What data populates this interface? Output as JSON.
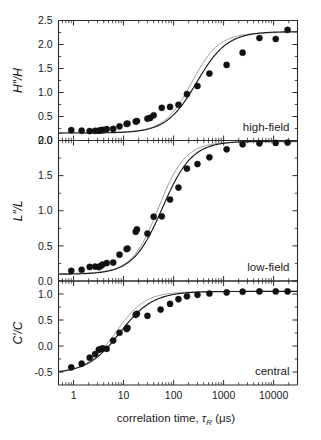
{
  "figure": {
    "width": 321,
    "height": 440,
    "background": "#ffffff",
    "ink": "#1a1a1a",
    "fit_color": "#1a1a1a",
    "fit_alt_color": "#9a9a9a",
    "marker_color": "#111111"
  },
  "xaxis": {
    "label": "correlation time,",
    "label_symbol": "τ",
    "label_subscript": "R",
    "label_units": "(μs)",
    "scale": "log",
    "min": 0.5,
    "max": 30000,
    "tick_values": [
      1,
      10,
      100,
      1000,
      10000
    ],
    "tick_labels": [
      "1",
      "10",
      "100",
      "1000",
      "10000"
    ]
  },
  "panels": [
    {
      "id": "high-field",
      "tag": "high-field",
      "ylabel": "H″/H",
      "ylabel_parts": {
        "main": "H",
        "prime": "″",
        "slash": "/",
        "denom": "H"
      },
      "ymin": 0.0,
      "ymax": 2.5,
      "ytick_values": [
        0.0,
        0.5,
        1.0,
        1.5,
        2.0,
        2.5
      ],
      "ytick_labels": [
        "0.0",
        "0.5",
        "1.0",
        "1.5",
        "2.0",
        "2.5"
      ],
      "yminor_step": 0.25
    },
    {
      "id": "low-field",
      "tag": "low-field",
      "ylabel": "L″/L",
      "ylabel_parts": {
        "main": "L",
        "prime": "″",
        "slash": "/",
        "denom": "L"
      },
      "ymin": 0.0,
      "ymax": 2.0,
      "ytick_values": [
        0.0,
        0.5,
        1.0,
        1.5,
        2.0
      ],
      "ytick_labels": [
        "0.0",
        "0.5",
        "1.0",
        "1.5",
        "2.0"
      ],
      "yminor_step": 0.25
    },
    {
      "id": "central",
      "tag": "central",
      "ylabel": "C′/C",
      "ylabel_parts": {
        "main": "C",
        "prime": "′",
        "slash": "/",
        "denom": "C"
      },
      "ymin": -0.75,
      "ymax": 1.25,
      "ytick_values": [
        -0.5,
        0.0,
        0.5,
        1.0
      ],
      "ytick_labels": [
        "-0.5",
        "0.0",
        "0.5",
        "1.0"
      ],
      "yminor_step": 0.25
    }
  ],
  "chart_data": [
    {
      "type": "scatter",
      "panel": "high-field",
      "title": "high-field",
      "xlabel": "correlation time, τR (μs)",
      "ylabel": "H″/H",
      "xscale": "log",
      "xlim": [
        0.5,
        30000
      ],
      "ylim": [
        0.0,
        2.5
      ],
      "grid": false,
      "legend": "none",
      "x": [
        0.9,
        1.45,
        2.1,
        2.7,
        3.2,
        3.5,
        3.8,
        4.6,
        6.2,
        8.3,
        11.5,
        12.0,
        17.5,
        18.5,
        30.0,
        34.0,
        40.0,
        58.0,
        85.0,
        125.0,
        185.0,
        300.0,
        520.0,
        1150.0,
        2400.0,
        5200.0,
        11000.0,
        19000.0
      ],
      "y": [
        0.215,
        0.205,
        0.197,
        0.203,
        0.205,
        0.213,
        0.222,
        0.238,
        0.242,
        0.295,
        0.345,
        0.352,
        0.395,
        0.405,
        0.455,
        0.47,
        0.525,
        0.68,
        0.7,
        0.745,
        0.965,
        1.135,
        1.395,
        1.575,
        1.83,
        2.135,
        2.115,
        2.305
      ],
      "series": [
        {
          "name": "fit-primary",
          "type": "line",
          "model": "sigmoid-log",
          "baseline": 0.155,
          "plateau": 2.27,
          "midpoint": 290.0,
          "slope": 0.92
        },
        {
          "name": "fit-alternate",
          "type": "line",
          "model": "sigmoid-log",
          "baseline": 0.165,
          "plateau": 2.25,
          "midpoint": 230.0,
          "slope": 1.02
        }
      ]
    },
    {
      "type": "scatter",
      "panel": "low-field",
      "title": "low-field",
      "xlabel": "correlation time, τR (μs)",
      "ylabel": "L″/L",
      "xscale": "log",
      "xlim": [
        0.5,
        30000
      ],
      "ylim": [
        0.0,
        2.0
      ],
      "grid": false,
      "legend": "none",
      "x": [
        0.9,
        1.45,
        2.1,
        2.7,
        3.2,
        3.5,
        3.8,
        4.6,
        6.2,
        8.3,
        11.5,
        12.0,
        17.5,
        18.5,
        30.0,
        40.0,
        58.0,
        85.0,
        125.0,
        185.0,
        300.0,
        520.0,
        1150.0,
        2400.0,
        5200.0,
        11000.0,
        19000.0
      ],
      "y": [
        0.145,
        0.16,
        0.2,
        0.205,
        0.198,
        0.215,
        0.235,
        0.255,
        0.262,
        0.375,
        0.455,
        0.462,
        0.7,
        0.735,
        0.675,
        0.915,
        0.92,
        1.16,
        1.33,
        1.6,
        1.665,
        1.76,
        1.875,
        1.945,
        1.96,
        1.965,
        1.97
      ],
      "series": [
        {
          "name": "fit-primary",
          "type": "line",
          "model": "sigmoid-log",
          "baseline": 0.095,
          "plateau": 1.99,
          "midpoint": 60.0,
          "slope": 0.95
        },
        {
          "name": "fit-alternate",
          "type": "line",
          "model": "sigmoid-log",
          "baseline": 0.105,
          "plateau": 1.98,
          "midpoint": 50.0,
          "slope": 1.05
        }
      ]
    },
    {
      "type": "scatter",
      "panel": "central",
      "title": "central",
      "xlabel": "correlation time, τR (μs)",
      "ylabel": "C′/C",
      "xscale": "log",
      "xlim": [
        0.5,
        30000
      ],
      "ylim": [
        -0.75,
        1.25
      ],
      "grid": false,
      "legend": "none",
      "x": [
        0.9,
        1.45,
        2.1,
        2.7,
        3.2,
        3.5,
        3.8,
        4.6,
        6.2,
        8.3,
        11.5,
        12.0,
        17.5,
        18.5,
        30.0,
        55.0,
        85.0,
        125.0,
        185.0,
        300.0,
        520.0,
        1150.0,
        2400.0,
        5200.0,
        11000.0,
        19000.0
      ],
      "y": [
        -0.41,
        -0.34,
        -0.225,
        -0.155,
        -0.07,
        -0.06,
        -0.045,
        -0.055,
        0.105,
        0.255,
        0.325,
        0.35,
        0.6,
        0.62,
        0.58,
        0.7,
        0.81,
        0.9,
        0.955,
        0.985,
        1.01,
        1.03,
        1.045,
        1.05,
        1.05,
        1.05
      ],
      "series": [
        {
          "name": "fit-primary",
          "type": "line",
          "model": "sigmoid-log",
          "baseline": -0.53,
          "plateau": 1.05,
          "midpoint": 8.5,
          "slope": 0.85
        },
        {
          "name": "fit-alternate",
          "type": "line",
          "model": "sigmoid-log",
          "baseline": -0.52,
          "plateau": 1.05,
          "midpoint": 7.0,
          "slope": 0.95
        }
      ]
    }
  ]
}
